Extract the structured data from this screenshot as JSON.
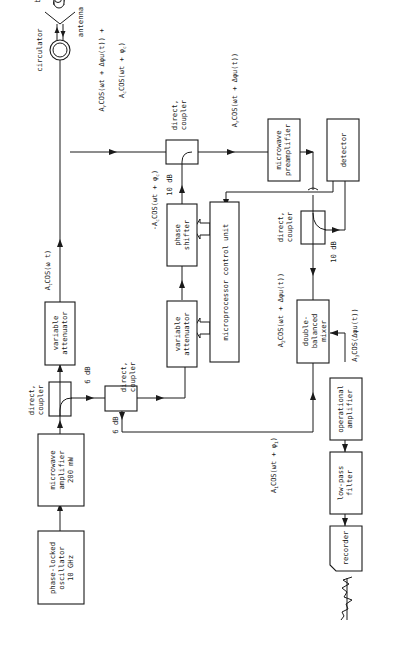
{
  "diagram": {
    "orientation": "rotated 90 degrees; text reads bottom-to-top",
    "blocks": {
      "oscillator": [
        "phase-locked",
        "oscillator",
        "10 GHz"
      ],
      "amplifier": [
        "microwave",
        "amplifier",
        "200 mW"
      ],
      "coupler1": [
        "direct,",
        "coupler"
      ],
      "coupler2": [
        "direct,",
        "coupler"
      ],
      "coupler3": [
        "direct,",
        "coupler"
      ],
      "coupler4": [
        "direct,",
        "coupler"
      ],
      "attenuator1": [
        "variable",
        "attenuator"
      ],
      "attenuator2": [
        "variable",
        "attenuator"
      ],
      "phase_shifter": [
        "phase",
        "shifter"
      ],
      "mcu": [
        "microprocessor control unit"
      ],
      "circulator": [
        "circulator"
      ],
      "antenna": [
        "antenna"
      ],
      "body": [
        "body"
      ],
      "preamplifier": [
        "microwave",
        "preamplifier"
      ],
      "detector": [
        "detector"
      ],
      "mixer": [
        "double-",
        "balanced",
        "mixer"
      ],
      "op_amp": [
        "operational",
        "amplifier"
      ],
      "lpf": [
        "low-pass",
        "filter"
      ],
      "recorder": [
        "recorder"
      ]
    },
    "levels": {
      "coupler1_tap": "6 dB",
      "coupler2_tap": "6 dB",
      "coupler3_tap": "10 dB",
      "coupler4_tap": "10 dB"
    },
    "signals": {
      "transmit": {
        "amp": "A",
        "sub": "t",
        "expr": "COS(ω t)"
      },
      "reflected_plus_clutter_1": {
        "amp": "A",
        "sub": "r",
        "expr": "COS(ωt + Δφu(t)) +"
      },
      "reflected_plus_clutter_2": {
        "amp": "A",
        "sub": "c",
        "expr": "COS(ωt + φ",
        "tail_sub": "c",
        "close": ")"
      },
      "cancel": {
        "amp": "-A",
        "sub": "c",
        "expr": "COS(ωt + φ",
        "tail_sub": "c",
        "close": ")"
      },
      "after_cancel": {
        "amp": "A",
        "sub": "r",
        "expr": "COS(ωt + Δφu(t))"
      },
      "mixer_rf": {
        "amp": "A",
        "sub": "2",
        "expr": "COS(ωt + Δφu(t))"
      },
      "mixer_lo": {
        "amp": "A",
        "sub": "1",
        "expr": "COS(ωt + φ",
        "tail_sub": "1",
        "close": ")"
      },
      "mixer_out": {
        "amp": "A",
        "sub": "3",
        "expr": "COS(Δφu(t))"
      }
    }
  }
}
